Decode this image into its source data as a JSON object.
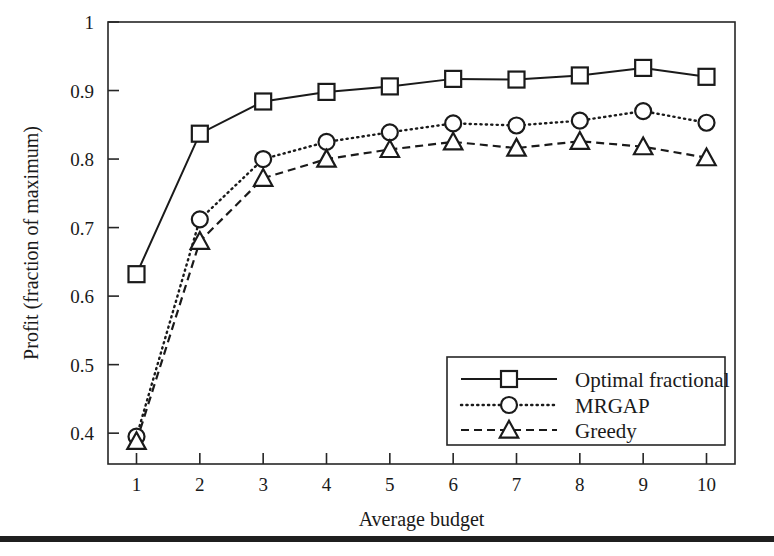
{
  "figure": {
    "background_color": "#ffffff",
    "ink_color": "#1a1a1a",
    "page_rule": {
      "name": "page-bottom-rule",
      "top": 536,
      "height": 6
    }
  },
  "chart_data": {
    "type": "line",
    "title": "",
    "xlabel": "Average budget",
    "ylabel": "Profit (fraction of maximum)",
    "x": [
      1,
      2,
      3,
      4,
      5,
      6,
      7,
      8,
      9,
      10
    ],
    "xtick_labels": [
      "1",
      "2",
      "3",
      "4",
      "5",
      "6",
      "7",
      "8",
      "9",
      "10"
    ],
    "ytick_labels": [
      "0.4",
      "0.5",
      "0.6",
      "0.7",
      "0.8",
      "0.9",
      "1"
    ],
    "yticks": [
      0.4,
      0.5,
      0.6,
      0.7,
      0.8,
      0.9,
      1.0
    ],
    "xlim": [
      0.55,
      10.45
    ],
    "ylim": [
      0.355,
      1.0
    ],
    "grid": false,
    "legend_position": "lower right",
    "series": [
      {
        "name": "Optimal fractional",
        "marker": "square",
        "linestyle": "solid",
        "values": [
          0.632,
          0.837,
          0.884,
          0.898,
          0.906,
          0.917,
          0.916,
          0.922,
          0.933,
          0.92
        ]
      },
      {
        "name": "MRGAP",
        "marker": "circle",
        "linestyle": "dotted",
        "values": [
          0.395,
          0.712,
          0.8,
          0.825,
          0.839,
          0.852,
          0.849,
          0.856,
          0.87,
          0.853
        ]
      },
      {
        "name": "Greedy",
        "marker": "triangle",
        "linestyle": "dashed",
        "values": [
          0.388,
          0.68,
          0.772,
          0.8,
          0.814,
          0.825,
          0.816,
          0.826,
          0.818,
          0.802
        ]
      }
    ]
  }
}
